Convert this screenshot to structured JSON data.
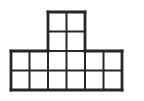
{
  "image": {
    "width": 144,
    "height": 101,
    "background_color": "#ffffff",
    "description": "Black-outlined square grid figure shaped like a T / podium"
  },
  "figure": {
    "name": "square-grid-figure",
    "shape_name": "T-shape",
    "line_color": "#262626",
    "fill_color": "#ffffff",
    "line_width": 2,
    "cell_width": 18.5,
    "cell_height": 19.5,
    "origin_x": 11,
    "origin_y": 12,
    "total_squares": 16,
    "sections": [
      {
        "name": "top-stack",
        "columns": 2,
        "rows": 2,
        "squares": 4,
        "col_offset": 2,
        "row_offset": 0
      },
      {
        "name": "bottom-base",
        "columns": 6,
        "rows": 2,
        "squares": 12,
        "col_offset": 0,
        "row_offset": 2
      }
    ],
    "occupied_cells": [
      [
        2,
        0
      ],
      [
        3,
        0
      ],
      [
        2,
        1
      ],
      [
        3,
        1
      ],
      [
        0,
        2
      ],
      [
        1,
        2
      ],
      [
        2,
        2
      ],
      [
        3,
        2
      ],
      [
        4,
        2
      ],
      [
        5,
        2
      ],
      [
        0,
        3
      ],
      [
        1,
        3
      ],
      [
        2,
        3
      ],
      [
        3,
        3
      ],
      [
        4,
        3
      ],
      [
        5,
        3
      ]
    ]
  },
  "chart_data": {
    "type": "heatmap",
    "title": "",
    "xlabel": "",
    "ylabel": "",
    "grid": true,
    "legend": "none",
    "columns": 6,
    "rows": 4,
    "xlim": [
      0,
      6
    ],
    "ylim": [
      0,
      4
    ],
    "cells": [
      [
        0,
        0,
        1,
        1,
        0,
        0
      ],
      [
        0,
        0,
        1,
        1,
        0,
        0
      ],
      [
        1,
        1,
        1,
        1,
        1,
        1
      ],
      [
        1,
        1,
        1,
        1,
        1,
        1
      ]
    ],
    "row_counts": [
      2,
      2,
      6,
      6
    ],
    "column_counts": [
      2,
      2,
      4,
      4,
      2,
      2
    ],
    "total_filled": 16
  }
}
